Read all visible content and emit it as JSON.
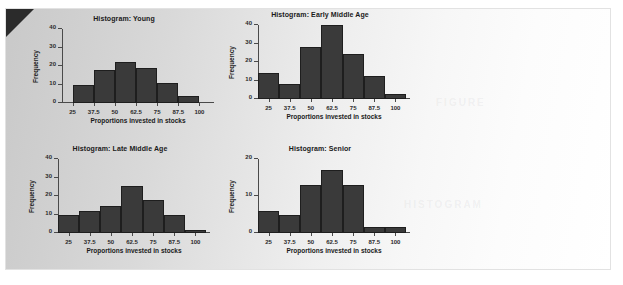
{
  "panel": {
    "corner_fold_color": "#2b2b2b",
    "background_left_color": "#c9c9c9",
    "background_right_color": "#ffffff",
    "ghost_text_1": "FIGURE",
    "ghost_text_2": "HISTOGRAM"
  },
  "chart_data": [
    {
      "type": "bar",
      "name": "young",
      "title": "Histogram: Young",
      "xlabel": "Proportions invested in stocks",
      "ylabel": "Frequency",
      "categories": [
        "25",
        "37.5",
        "50",
        "62.5",
        "75",
        "87.5",
        "100"
      ],
      "bin_centers": [
        31.25,
        43.75,
        56.25,
        68.75,
        81.25,
        93.75
      ],
      "values": [
        10,
        18,
        22,
        19,
        11,
        4
      ],
      "xlim": [
        18.75,
        106.25
      ],
      "ylim": [
        0,
        40
      ],
      "yticks": [
        0,
        10,
        20,
        30,
        40
      ],
      "grid": false,
      "bar_color": "#3a3a3a"
    },
    {
      "type": "bar",
      "name": "early-middle-age",
      "title": "Histogram: Early Middle Age",
      "xlabel": "Proportions invested in stocks",
      "ylabel": "Frequency",
      "categories": [
        "25",
        "37.5",
        "50",
        "62.5",
        "75",
        "87.5",
        "100"
      ],
      "bin_centers": [
        25,
        37.5,
        50,
        62.5,
        75,
        87.5,
        100
      ],
      "values": [
        14,
        8,
        28,
        40,
        24.5,
        12.5,
        2.5
      ],
      "xlim": [
        18.75,
        106.25
      ],
      "ylim": [
        0,
        40
      ],
      "yticks": [
        0,
        10,
        20,
        30,
        40
      ],
      "grid": false,
      "bar_color": "#3a3a3a"
    },
    {
      "type": "bar",
      "name": "late-middle-age",
      "title": "Histogram: Late Middle Age",
      "xlabel": "Proportions invested in stocks",
      "ylabel": "Frequency",
      "categories": [
        "25",
        "37.5",
        "50",
        "62.5",
        "75",
        "87.5",
        "100"
      ],
      "bin_centers": [
        25,
        37.5,
        50,
        62.5,
        75,
        87.5,
        100
      ],
      "values": [
        10,
        12,
        14.5,
        25.5,
        18,
        10,
        1.5
      ],
      "xlim": [
        18.75,
        106.25
      ],
      "ylim": [
        0,
        40
      ],
      "yticks": [
        0,
        10,
        20,
        30,
        40
      ],
      "grid": false,
      "bar_color": "#3a3a3a"
    },
    {
      "type": "bar",
      "name": "senior",
      "title": "Histogram: Senior",
      "xlabel": "Proportions invested in stocks",
      "ylabel": "Frequency",
      "categories": [
        "25",
        "37.5",
        "50",
        "62.5",
        "75",
        "87.5",
        "100"
      ],
      "bin_centers": [
        25,
        37.5,
        50,
        62.5,
        75,
        87.5,
        100
      ],
      "values": [
        6,
        5,
        13,
        17,
        13,
        1.5,
        1.5
      ],
      "xlim": [
        18.75,
        106.25
      ],
      "ylim": [
        0,
        20
      ],
      "yticks": [
        0,
        10,
        20
      ],
      "grid": false,
      "bar_color": "#3a3a3a"
    }
  ]
}
